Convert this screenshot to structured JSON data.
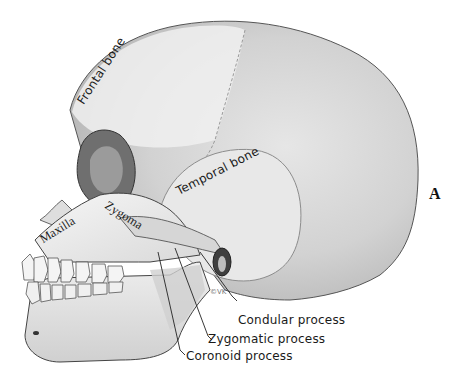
{
  "figure": {
    "panel_letter": "A",
    "artist_signature": "©VK",
    "labels": {
      "frontal_bone": "Frontal bone",
      "temporal_bone": "Temporal bone",
      "zygoma": "Zygoma",
      "maxilla": "Maxilla",
      "condular_process": "Condular process",
      "zygomatic_process": "Zygomatic process",
      "coronoid_process": "Coronoid process"
    },
    "colors": {
      "background": "#ffffff",
      "bone_light": "#ececec",
      "bone_mid": "#cfcfcf",
      "bone_dark": "#8a8a8a",
      "line": "#222222"
    }
  }
}
